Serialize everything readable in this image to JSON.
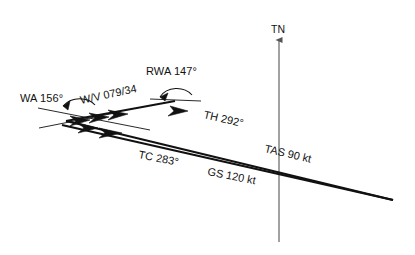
{
  "diagram": {
    "type": "wind-triangle",
    "background_color": "#ffffff",
    "line_color": "#111111",
    "axis_color": "#555555",
    "labels": {
      "true_north": "TN",
      "wind_angle": "WA 156°",
      "wind_velocity": "W/V 079/34",
      "relative_wind_angle": "RWA 147°",
      "true_heading": "TH 292°",
      "true_airspeed": "TAS 90 kt",
      "true_course": "TC 283°",
      "ground_speed": "GS 120 kt"
    },
    "values": {
      "wind_angle_deg": 156,
      "relative_wind_angle_deg": 147,
      "wind_direction_deg": 79,
      "wind_speed_kt": 34,
      "true_heading_deg": 292,
      "true_airspeed_kt": 90,
      "true_course_deg": 283,
      "ground_speed_kt": 120
    },
    "vectors": [
      {
        "name": "true-airspeed-heading-vector",
        "label": "TAS 90 kt",
        "angle_label": "TH 292°",
        "magnitude_kt": 90,
        "direction_deg": 292
      },
      {
        "name": "ground-speed-course-vector",
        "label": "GS 120 kt",
        "angle_label": "TC 283°",
        "magnitude_kt": 120,
        "direction_deg": 283
      },
      {
        "name": "wind-vector",
        "label": "W/V 079/34",
        "magnitude_kt": 34,
        "direction_deg": 79
      }
    ]
  }
}
